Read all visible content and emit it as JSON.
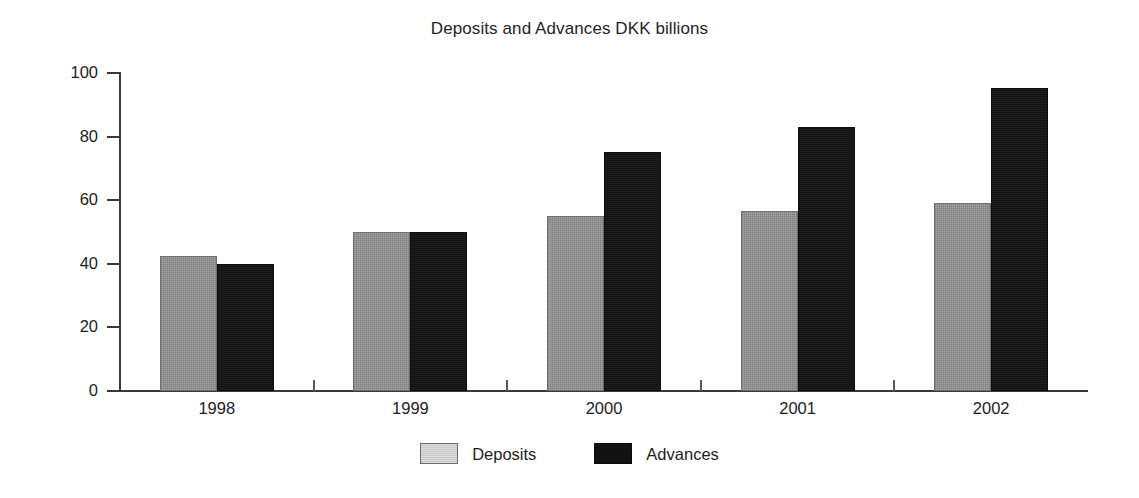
{
  "chart_data": {
    "type": "bar",
    "title": "Deposits and Advances DKK billions",
    "xlabel": "",
    "ylabel": "",
    "categories": [
      "1998",
      "1999",
      "2000",
      "2001",
      "2002"
    ],
    "series": [
      {
        "name": "Deposits",
        "color": "#8d8d8d",
        "values": [
          42.5,
          50.0,
          55.0,
          56.5,
          59.0
        ]
      },
      {
        "name": "Advances",
        "color": "#131313",
        "values": [
          40.0,
          50.0,
          75.2,
          83.0,
          95.3
        ]
      }
    ],
    "ylim": [
      0,
      100
    ],
    "yticks": [
      0,
      20,
      40,
      60,
      80,
      100
    ],
    "ytick_labels": [
      "0",
      "20",
      "40",
      "60",
      "80",
      "100"
    ],
    "grid": false,
    "legend_position": "bottom-center"
  },
  "legend": {
    "entries": [
      {
        "label": "Deposits",
        "swatch": "deposits-swatch"
      },
      {
        "label": "Advances",
        "swatch": "advances-swatch"
      }
    ]
  },
  "colors": {
    "deposits": "#8d8d8d",
    "advances": "#131313",
    "axis": "#3a3a3a",
    "text": "#1d1d1d",
    "background": "#ffffff"
  }
}
